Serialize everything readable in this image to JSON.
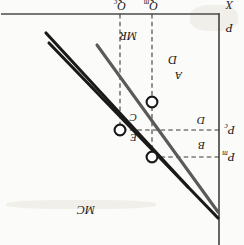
{
  "figure": {
    "orientation": "rotated-180",
    "background_color": "#fbfbf9"
  },
  "axes": {
    "vertical_axis_label": "P",
    "horizontal_axis_label": "X",
    "axis_color": "#4b4b4b"
  },
  "curves": [
    {
      "id": "demand",
      "label": "D",
      "color": "#1a1a1a"
    },
    {
      "id": "marginal-revenue",
      "label": "MR",
      "color": "#5a5a5a"
    },
    {
      "id": "marginal-cost",
      "label": "MC",
      "color": "#1a1a1a"
    }
  ],
  "price_ticks": [
    {
      "id": "pm",
      "label": "P",
      "sub": "m"
    },
    {
      "id": "pc",
      "label": "P",
      "sub": "c"
    }
  ],
  "quantity_ticks": [
    {
      "id": "qm",
      "label": "Q",
      "sub": "m"
    },
    {
      "id": "qc",
      "label": "Q",
      "sub": "c"
    }
  ],
  "regions": [
    {
      "id": "a",
      "label": "A"
    },
    {
      "id": "b",
      "label": "B"
    },
    {
      "id": "c",
      "label": "C"
    },
    {
      "id": "d",
      "label": "D"
    }
  ],
  "points": [
    {
      "id": "monopoly-price-point",
      "label": ""
    },
    {
      "id": "competitive-equilibrium",
      "label": ""
    },
    {
      "id": "monopoly-output-point",
      "label": ""
    }
  ],
  "region_labels": {
    "e": "E"
  },
  "colors": {
    "ink_dark": "#1a1a1a",
    "ink_mid": "#5a5a5a",
    "axis": "#4b4b4b",
    "dashed": "#3b3b3b",
    "marker_fill": "#ffffff"
  }
}
